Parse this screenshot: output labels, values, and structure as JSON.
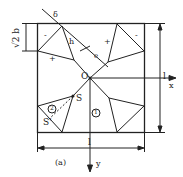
{
  "figure": {
    "caption": "(a)",
    "axes": {
      "x_label": "x",
      "y_label": "y",
      "origin_label": "O"
    },
    "dimensions": {
      "left": "√2 b",
      "right": "l",
      "bottom": "l",
      "top_offset": "δ",
      "diagonal_h": "h",
      "diagonal_e": "e"
    },
    "region_labels": {
      "region_1": "1",
      "region_2": "2"
    },
    "point_labels": {
      "s_upper": "S",
      "s_lower": "S'"
    },
    "signs": {
      "minus_tl": "-",
      "plus_tl": "+",
      "plus_tr": "+",
      "minus_tr": "-"
    },
    "colors": {
      "line": "#222222",
      "background": "#ffffff"
    }
  }
}
